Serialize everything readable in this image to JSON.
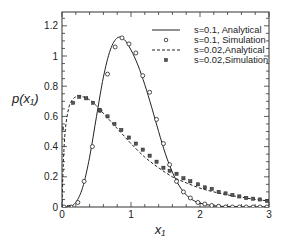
{
  "chart_data": {
    "type": "line",
    "title": "",
    "xlabel": "x₁",
    "ylabel": "p(x₁)",
    "xlim": [
      0,
      3
    ],
    "ylim": [
      0,
      1.3
    ],
    "xticks": [
      0,
      1,
      2,
      3
    ],
    "xtick_labels": [
      "0",
      "1",
      "2",
      "3"
    ],
    "yticks": [
      0,
      0.2,
      0.4,
      0.6,
      0.8,
      1.0,
      1.2
    ],
    "ytick_labels": [
      "0",
      "0.2",
      "0.4",
      "0.6",
      "0.8",
      "1",
      "1.2"
    ],
    "grid": false,
    "legend_position": "upper right",
    "series": [
      {
        "name": "s=0.1, Analytical",
        "style": "solid-line",
        "x": [
          0.0,
          0.1,
          0.2,
          0.3,
          0.4,
          0.5,
          0.6,
          0.7,
          0.8,
          0.9,
          1.0,
          1.1,
          1.2,
          1.3,
          1.4,
          1.5,
          1.6,
          1.7,
          1.8,
          1.9,
          2.0,
          2.2,
          2.4,
          2.6,
          2.8,
          3.0
        ],
        "y": [
          0.0,
          0.0,
          0.03,
          0.13,
          0.33,
          0.6,
          0.86,
          1.04,
          1.12,
          1.11,
          1.04,
          0.94,
          0.81,
          0.66,
          0.5,
          0.35,
          0.23,
          0.14,
          0.08,
          0.045,
          0.025,
          0.008,
          0.003,
          0.001,
          0.0,
          0.0
        ]
      },
      {
        "name": "s=0.1, Simulation",
        "style": "open-circle",
        "x": [
          0.03,
          0.13,
          0.23,
          0.32,
          0.44,
          0.55,
          0.66,
          0.77,
          0.87,
          0.97,
          1.07,
          1.17,
          1.27,
          1.37,
          1.47,
          1.56,
          1.66,
          1.76,
          1.86,
          1.97,
          2.07,
          2.17,
          2.27,
          2.37,
          2.47,
          2.57,
          2.67,
          2.77,
          2.87,
          2.97
        ],
        "y": [
          0.0,
          0.0,
          0.03,
          0.17,
          0.4,
          0.64,
          0.88,
          1.06,
          1.12,
          1.08,
          1.02,
          0.87,
          0.76,
          0.58,
          0.42,
          0.28,
          0.17,
          0.1,
          0.06,
          0.03,
          0.02,
          0.01,
          0.005,
          0.0,
          0.0,
          0.0,
          0.0,
          0.0,
          0.0,
          0.0
        ]
      },
      {
        "name": "s=0.02,Analytical",
        "style": "dashed-line",
        "x": [
          0.0,
          0.02,
          0.05,
          0.1,
          0.15,
          0.2,
          0.25,
          0.3,
          0.4,
          0.5,
          0.6,
          0.7,
          0.8,
          0.9,
          1.0,
          1.2,
          1.4,
          1.6,
          1.8,
          2.0,
          2.2,
          2.4,
          2.6,
          2.8,
          3.0
        ],
        "y": [
          0.0,
          0.3,
          0.52,
          0.66,
          0.71,
          0.73,
          0.735,
          0.73,
          0.71,
          0.67,
          0.62,
          0.57,
          0.52,
          0.47,
          0.42,
          0.33,
          0.26,
          0.2,
          0.16,
          0.125,
          0.1,
          0.08,
          0.065,
          0.05,
          0.04
        ]
      },
      {
        "name": "s=0.02,Simulation",
        "style": "filled-square",
        "x": [
          0.0,
          0.1,
          0.16,
          0.25,
          0.35,
          0.45,
          0.55,
          0.66,
          0.76,
          0.86,
          0.97,
          1.07,
          1.17,
          1.27,
          1.37,
          1.47,
          1.56,
          1.66,
          1.76,
          1.86,
          1.97,
          2.07,
          2.17,
          2.27,
          2.37,
          2.47,
          2.57,
          2.67,
          2.77,
          2.87,
          2.97
        ],
        "y": [
          0.52,
          0.0,
          0.69,
          0.73,
          0.72,
          0.69,
          0.64,
          0.6,
          0.55,
          0.51,
          0.46,
          0.42,
          0.38,
          0.34,
          0.3,
          0.26,
          0.24,
          0.22,
          0.19,
          0.17,
          0.15,
          0.13,
          0.12,
          0.1,
          0.09,
          0.08,
          0.07,
          0.06,
          0.055,
          0.05,
          0.04
        ]
      }
    ]
  },
  "legend": {
    "items": [
      {
        "label": "s=0.1, Analytical",
        "marker": "solid-line"
      },
      {
        "label": "s=0.1, Simulation",
        "marker": "open-circle"
      },
      {
        "label": "s=0.02,Analytical",
        "marker": "dashed-line"
      },
      {
        "label": "s=0.02,Simulation",
        "marker": "filled-square"
      }
    ]
  },
  "axes": {
    "ylabel": "p(x₁)",
    "xlabel": "x₁"
  }
}
